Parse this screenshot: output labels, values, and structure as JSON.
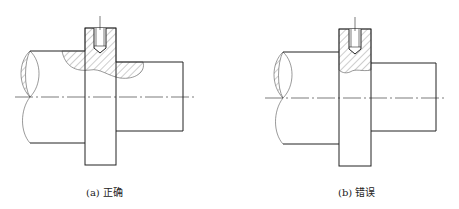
{
  "figures": [
    {
      "id": "a",
      "caption": "(a) 正确"
    },
    {
      "id": "b",
      "caption": "(b) 错误"
    }
  ],
  "colors": {
    "line": "#222222",
    "hatch": "#555555",
    "background": "#ffffff"
  }
}
